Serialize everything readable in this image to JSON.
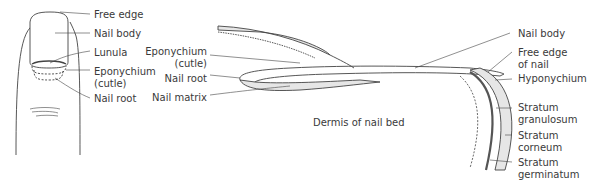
{
  "left_figure": {
    "labels": {
      "free_edge": "Free edge",
      "nail_body": "Nail body",
      "lunula": "Lunula",
      "eponychium_1": "Eponychium",
      "eponychium_2": "(cutle)",
      "nail_root": "Nail root"
    }
  },
  "right_figure": {
    "left_labels": {
      "eponychium_1": "Eponychium",
      "eponychium_2": "(cutle)",
      "nail_root": "Nail root",
      "nail_matrix": "Nail matrix"
    },
    "center_label": "Dermis of nail bed",
    "right_labels": {
      "nail_body": "Nail body",
      "free_edge_1": "Free edge",
      "free_edge_2": "of nail",
      "hyponychium": "Hyponychium",
      "stratum_granulosum_1": "Stratum",
      "stratum_granulosum_2": "granulosum",
      "stratum_corneum_1": "Stratum",
      "stratum_corneum_2": "corneum",
      "stratum_germinatum_1": "Stratum",
      "stratum_germinatum_2": "germinatum"
    }
  },
  "colors": {
    "line": "#444444",
    "fill_light": "#e6e6e6",
    "fill_dark": "#555555"
  }
}
